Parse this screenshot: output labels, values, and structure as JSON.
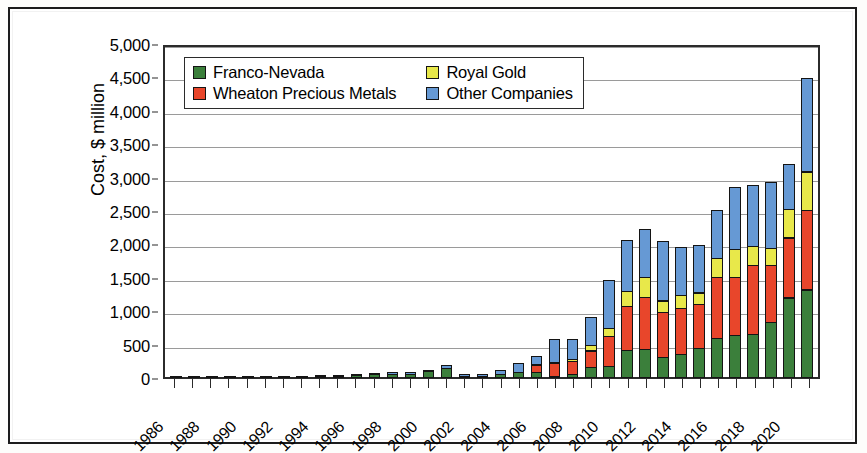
{
  "chart_data": {
    "type": "bar",
    "stacked": true,
    "title": "",
    "xlabel": "",
    "ylabel": "Cost, $ million",
    "ylim": [
      0,
      5000
    ],
    "ytick_step": 500,
    "ytick_labels": [
      "0",
      "500",
      "1,000",
      "1,500",
      "2,000",
      "2,500",
      "3,000",
      "3,500",
      "4,000",
      "4,500",
      "5,000"
    ],
    "grid": true,
    "legend_position": "top-left-inside",
    "xtick_label_every": 2,
    "categories": [
      "1986",
      "1987",
      "1988",
      "1989",
      "1990",
      "1991",
      "1992",
      "1993",
      "1994",
      "1995",
      "1996",
      "1997",
      "1998",
      "1999",
      "2000",
      "2001",
      "2002",
      "2003",
      "2004",
      "2005",
      "2006",
      "2007",
      "2008",
      "2009",
      "2010",
      "2011",
      "2012",
      "2013",
      "2014",
      "2015",
      "2016",
      "2017",
      "2018",
      "2019",
      "2020",
      "2021"
    ],
    "xtick_labels_shown": [
      "1986",
      "",
      "1988",
      "",
      "1990",
      "",
      "1992",
      "",
      "1994",
      "",
      "1996",
      "",
      "1998",
      "",
      "2000",
      "",
      "2002",
      "",
      "2004",
      "",
      "2006",
      "",
      "2008",
      "",
      "2010",
      "",
      "2012",
      "",
      "2014",
      "",
      "2016",
      "",
      "2018",
      "",
      "2020",
      ""
    ],
    "series": [
      {
        "name": "Franco-Nevada",
        "color": "#3b7f3b",
        "values": [
          2,
          3,
          3,
          4,
          5,
          5,
          6,
          8,
          20,
          30,
          45,
          60,
          60,
          60,
          95,
          150,
          15,
          20,
          60,
          90,
          80,
          30,
          50,
          160,
          180,
          420,
          430,
          310,
          350,
          440,
          600,
          640,
          660,
          830,
          1200,
          1320
        ]
      },
      {
        "name": "Wheaton Precious Metals",
        "color": "#e8462b",
        "values": [
          0,
          0,
          0,
          0,
          0,
          0,
          0,
          0,
          0,
          0,
          0,
          0,
          0,
          0,
          0,
          0,
          0,
          0,
          0,
          0,
          130,
          200,
          215,
          260,
          460,
          670,
          790,
          680,
          700,
          680,
          920,
          880,
          1040,
          870,
          910,
          1200
        ]
      },
      {
        "name": "Royal Gold",
        "color": "#e8e84a",
        "values": [
          0,
          0,
          0,
          0,
          0,
          0,
          0,
          0,
          0,
          0,
          0,
          0,
          0,
          0,
          0,
          0,
          0,
          0,
          0,
          0,
          0,
          20,
          45,
          90,
          130,
          230,
          310,
          190,
          210,
          180,
          300,
          430,
          300,
          260,
          440,
          590
        ]
      },
      {
        "name": "Other Companies",
        "color": "#6699d4",
        "values": [
          0,
          0,
          0,
          0,
          0,
          0,
          0,
          0,
          5,
          10,
          25,
          30,
          40,
          45,
          40,
          50,
          35,
          40,
          70,
          150,
          140,
          350,
          300,
          440,
          730,
          780,
          730,
          900,
          740,
          720,
          730,
          940,
          930,
          1000,
          690,
          1410
        ]
      }
    ],
    "totals": [
      2,
      3,
      3,
      4,
      5,
      5,
      6,
      8,
      25,
      40,
      70,
      90,
      100,
      105,
      135,
      200,
      50,
      60,
      130,
      240,
      350,
      600,
      610,
      950,
      1500,
      2100,
      2260,
      2080,
      2000,
      2020,
      2550,
      2890,
      2930,
      2960,
      3240,
      4520
    ]
  },
  "legend": {
    "items": [
      {
        "label": "Franco-Nevada",
        "swatch": "fn"
      },
      {
        "label": "Royal Gold",
        "swatch": "rg"
      },
      {
        "label": "Wheaton Precious Metals",
        "swatch": "wpm"
      },
      {
        "label": "Other Companies",
        "swatch": "oc"
      }
    ]
  },
  "axes": {
    "y_title": "Cost, $ million"
  }
}
